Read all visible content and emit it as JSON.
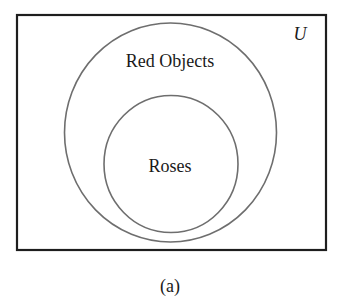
{
  "diagram": {
    "type": "venn",
    "universe_label": "U",
    "sets": [
      {
        "name": "red-objects",
        "label": "Red Objects"
      },
      {
        "name": "roses",
        "label": "Roses",
        "subset_of": "Red Objects"
      }
    ],
    "caption": "(a)",
    "colors": {
      "frame": "#1e1e1e",
      "circle": "#6e6e6e",
      "text": "#1a1a1a",
      "background": "#ffffff"
    }
  }
}
